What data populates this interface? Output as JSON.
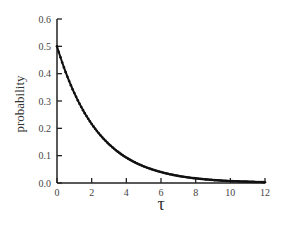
{
  "chart_data": {
    "type": "line",
    "title": "",
    "xlabel": "τ",
    "ylabel": "probability",
    "xlim": [
      0,
      12
    ],
    "ylim": [
      0,
      0.6
    ],
    "xticks": [
      "0",
      "2",
      "4",
      "6",
      "8",
      "10",
      "12"
    ],
    "yticks": [
      "0.0",
      "0.1",
      "0.2",
      "0.3",
      "0.4",
      "0.5",
      "0.6"
    ],
    "grid": false,
    "legend": null,
    "series": [
      {
        "name": "probability",
        "marker": "dot",
        "color": "#111111",
        "x": [
          0,
          1,
          2,
          3,
          4,
          5,
          6,
          7,
          8,
          9,
          10,
          11,
          12
        ],
        "values": [
          0.5,
          0.329,
          0.216,
          0.142,
          0.093,
          0.061,
          0.04,
          0.026,
          0.017,
          0.011,
          0.007,
          0.005,
          0.003
        ]
      }
    ],
    "model": "0.5 * exp(-0.42 * tau)"
  }
}
